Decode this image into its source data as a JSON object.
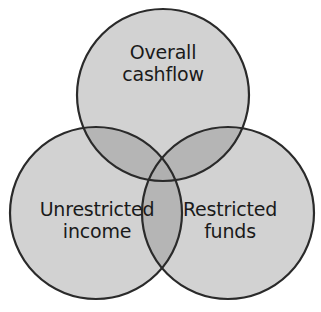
{
  "diagram": {
    "type": "venn",
    "set_count": 3,
    "background_color": "#ffffff",
    "fill_color": "#d2d2d2",
    "overlap_color": "#b5b5b5",
    "stroke_color": "#2a2a2a",
    "text_color": "#1a1a1a",
    "circles": [
      {
        "id": "overall-cashflow",
        "label": "Overall\ncashflow",
        "position": "top",
        "cx": 163,
        "cy": 95,
        "r": 86
      },
      {
        "id": "unrestricted-income",
        "label": "Unrestricted\nincome",
        "position": "bottom-left",
        "cx": 96,
        "cy": 213,
        "r": 86
      },
      {
        "id": "restricted-funds",
        "label": "Restricted\nfunds",
        "position": "bottom-right",
        "cx": 228,
        "cy": 213,
        "r": 86
      }
    ]
  }
}
